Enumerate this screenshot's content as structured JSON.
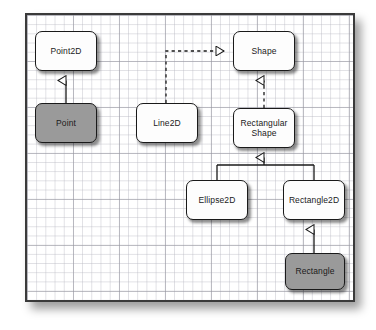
{
  "diagram": {
    "kind": "uml-class-diagram",
    "background": "graph-paper",
    "frame": {
      "border_color": "#3a3a3a",
      "fill": "#ffffff"
    },
    "palette": {
      "box_fill_white": "#fdfdfd",
      "box_fill_gray": "#9a9a9a",
      "box_stroke": "#1a1a1a",
      "connector": "#1a1a1a",
      "grid_line": "#9696a0"
    },
    "nodes": [
      {
        "id": "point2d",
        "label": "Point2D",
        "fill": "white",
        "x": 35,
        "y": 31,
        "w": 62,
        "h": 40
      },
      {
        "id": "point",
        "label": "Point",
        "fill": "gray",
        "x": 35,
        "y": 103,
        "w": 62,
        "h": 40
      },
      {
        "id": "line2d",
        "label": "Line2D",
        "fill": "white",
        "x": 136,
        "y": 103,
        "w": 62,
        "h": 40
      },
      {
        "id": "shape",
        "label": "Shape",
        "fill": "white",
        "x": 233,
        "y": 31,
        "w": 62,
        "h": 40
      },
      {
        "id": "rectshape",
        "label": "Rectangular Shape",
        "fill": "white",
        "x": 233,
        "y": 108,
        "w": 62,
        "h": 40
      },
      {
        "id": "ellipse2d",
        "label": "Ellipse2D",
        "fill": "white",
        "x": 186,
        "y": 180,
        "w": 62,
        "h": 40
      },
      {
        "id": "rect2d",
        "label": "Rectangle2D",
        "fill": "white",
        "x": 283,
        "y": 180,
        "w": 62,
        "h": 40
      },
      {
        "id": "rectangle",
        "label": "Rectangle",
        "fill": "gray",
        "x": 285,
        "y": 253,
        "w": 60,
        "h": 37
      }
    ],
    "edges": [
      {
        "id": "point-to-point2d",
        "from": "point",
        "to": "point2d",
        "style": "solid",
        "arrow": "hollow-triangle",
        "meaning": "generalization"
      },
      {
        "id": "line2d-to-shape",
        "from": "line2d",
        "to": "shape",
        "style": "dashed",
        "arrow": "hollow-triangle",
        "meaning": "realization"
      },
      {
        "id": "rectshape-to-shape",
        "from": "rectshape",
        "to": "shape",
        "style": "dashed",
        "arrow": "hollow-triangle",
        "meaning": "realization"
      },
      {
        "id": "ellipse2d-to-rectshape",
        "from": "ellipse2d",
        "to": "rectshape",
        "style": "solid",
        "arrow": "hollow-triangle",
        "meaning": "generalization"
      },
      {
        "id": "rect2d-to-rectshape",
        "from": "rect2d",
        "to": "rectshape",
        "style": "solid",
        "arrow": "hollow-triangle",
        "meaning": "generalization"
      },
      {
        "id": "rectangle-to-rect2d",
        "from": "rectangle",
        "to": "rect2d",
        "style": "solid",
        "arrow": "hollow-triangle",
        "meaning": "generalization"
      }
    ]
  }
}
